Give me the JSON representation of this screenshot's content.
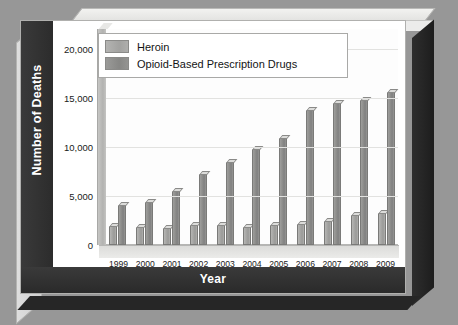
{
  "chart_data": {
    "type": "bar",
    "title": "",
    "xlabel": "Year",
    "ylabel": "Number of Deaths",
    "categories": [
      "1999",
      "2000",
      "2001",
      "2002",
      "2003",
      "2004",
      "2005",
      "2006",
      "2007",
      "2008",
      "2009"
    ],
    "series": [
      {
        "name": "Heroin",
        "color": "#a3a3a1",
        "values": [
          1960,
          1840,
          1780,
          2080,
          2080,
          1880,
          2010,
          2090,
          2400,
          3040,
          3280
        ]
      },
      {
        "name": "Opioid-Based Prescription Drugs",
        "color": "#8b8b89",
        "values": [
          4030,
          4400,
          5530,
          7200,
          8500,
          9780,
          10930,
          13720,
          14460,
          14800,
          15600
        ]
      }
    ],
    "ylim": [
      0,
      22000
    ],
    "yticks": [
      0,
      5000,
      10000,
      15000,
      20000
    ],
    "ytick_labels": [
      "0",
      "5,000",
      "10,000",
      "15,000",
      "20,000"
    ],
    "grid": true,
    "legend_position": "top-left"
  },
  "legend": {
    "items": [
      {
        "label": "Heroin",
        "swatch": "heroin"
      },
      {
        "label": "Opioid-Based Prescription Drugs",
        "swatch": "opioid"
      }
    ]
  },
  "axes": {
    "y_title": "Number of Deaths",
    "x_title": "Year"
  },
  "colors": {
    "background": "#979797",
    "face": "#ffffff",
    "band": "#2e2e2e",
    "heroin": "#a3a3a1",
    "opioid": "#8b8b89",
    "grid": "#e2e2e0"
  }
}
